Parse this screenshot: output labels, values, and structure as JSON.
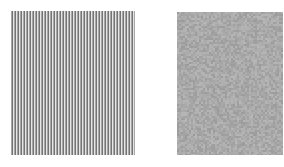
{
  "figure": {
    "width": 284,
    "height": 167,
    "background": "#ffffff",
    "panels": [
      {
        "id": "grating",
        "kind": "vertical-stripe-grating",
        "x": 11,
        "y": 11,
        "width": 124,
        "height": 144,
        "stripe_period_px": 3,
        "stripe_width_px": 1.4,
        "stripe_color": "#686868",
        "gap_color": "#e6e6e6"
      },
      {
        "id": "noise",
        "kind": "gray-noise-patch",
        "x": 177,
        "y": 12,
        "width": 106,
        "height": 143,
        "base_color": "#a9a9a9",
        "noise_amplitude": 14
      }
    ]
  }
}
